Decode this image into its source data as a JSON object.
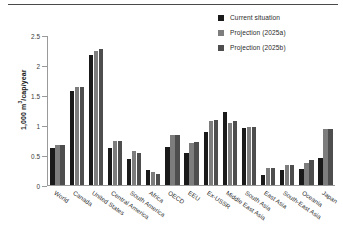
{
  "chart_data": {
    "type": "bar",
    "title": "",
    "subtitle": "",
    "xlabel": "",
    "ylabel": "1,000 m3/cap/year",
    "ylabel_parts": {
      "prefix": "1,000 m",
      "sup": "3",
      "suffix": "/cap/year"
    },
    "ylim": [
      0,
      2.5
    ],
    "yticks": [
      0,
      0.5,
      1,
      1.5,
      2,
      2.5
    ],
    "ytick_labels": [
      "0",
      "0.5",
      "1",
      "1.5",
      "2",
      "2.5"
    ],
    "grid": false,
    "legend_position": "top-right",
    "categories": [
      "World",
      "Canada",
      "United States",
      "Central America",
      "South America",
      "Africa",
      "OECD",
      "EEU",
      "Ex-USSR",
      "Middle East Asia",
      "South Asia",
      "East Asia",
      "South-East Asia",
      "Oceania",
      "Japan"
    ],
    "series": [
      {
        "name": "Current situation",
        "color": "#1a1a1a",
        "values": [
          0.61,
          1.56,
          2.16,
          0.61,
          0.43,
          0.25,
          0.63,
          0.53,
          0.88,
          1.21,
          0.95,
          0.16,
          0.25,
          0.27,
          0.45
        ]
      },
      {
        "name": "Projection (2025a)",
        "color": "#7d7d7d",
        "values": [
          0.67,
          1.63,
          2.24,
          0.73,
          0.56,
          0.21,
          0.83,
          0.7,
          1.06,
          1.03,
          0.97,
          0.28,
          0.33,
          0.37,
          0.93
        ]
      },
      {
        "name": "Projection (2025b)",
        "color": "#4e4e4e",
        "values": [
          0.66,
          1.64,
          2.27,
          0.73,
          0.54,
          0.19,
          0.83,
          0.72,
          1.08,
          1.07,
          0.96,
          0.29,
          0.33,
          0.41,
          0.93
        ]
      }
    ]
  }
}
